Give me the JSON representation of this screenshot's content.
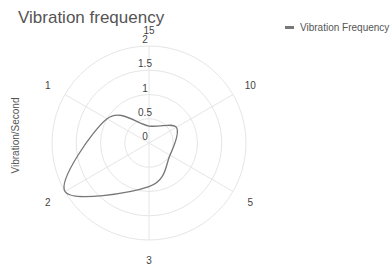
{
  "chart_data": {
    "type": "radar",
    "title": "Vibration frequency",
    "ylabel": "Vibration/Second",
    "categories": [
      "15",
      "10",
      "5",
      "3",
      "2",
      "1"
    ],
    "series": [
      {
        "name": "Vibration Frequency",
        "values": [
          0.35,
          0.65,
          0.5,
          0.9,
          2.0,
          1.0
        ],
        "color": "#777777"
      }
    ],
    "radial_ticks": [
      "0",
      "0.5",
      "1",
      "1.5",
      "2"
    ],
    "rlim": [
      0,
      2
    ],
    "grid": true,
    "legend_position": "top-right"
  },
  "legend": {
    "label": "Vibration Frequency"
  }
}
